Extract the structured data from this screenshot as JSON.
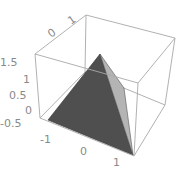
{
  "chart_data": {
    "type": "surface3d",
    "title": "",
    "axes": {
      "x": {
        "ticks": [
          "-1",
          "0",
          "1"
        ],
        "range": [
          -1.2,
          1.2
        ]
      },
      "y": {
        "ticks": [
          "0",
          "1"
        ],
        "range": [
          -0.2,
          1.2
        ]
      },
      "z": {
        "ticks": [
          "-0.5",
          "0",
          "0.5",
          "1",
          "1.5"
        ],
        "range": [
          -0.6,
          1.6
        ]
      }
    },
    "box_edges_color": "#a8a8a8",
    "faces": [
      {
        "name": "front-face",
        "color": "#4f4f4f",
        "points": "48,120 100,54 133,155"
      },
      {
        "name": "side-face",
        "color": "#b4b4b4",
        "points": "100,54 124,88 133,155"
      }
    ],
    "tick_labels": {
      "z": [
        {
          "text": "1.5",
          "x": 0,
          "y": 58
        },
        {
          "text": "1",
          "x": 22,
          "y": 76
        },
        {
          "text": "0.5",
          "x": 8,
          "y": 92
        },
        {
          "text": "0",
          "x": 24,
          "y": 109
        },
        {
          "text": "-0.5",
          "x": 0,
          "y": 125
        }
      ],
      "x": [
        {
          "text": "-1",
          "x": 40,
          "y": 136
        },
        {
          "text": "0",
          "x": 80,
          "y": 151
        },
        {
          "text": "1",
          "x": 113,
          "y": 165
        }
      ],
      "y": [
        {
          "text": "0",
          "x": 51,
          "y": 37
        },
        {
          "text": "1",
          "x": 70,
          "y": 24
        }
      ]
    }
  }
}
